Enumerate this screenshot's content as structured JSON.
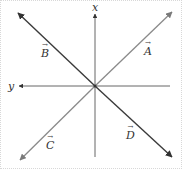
{
  "diagram": {
    "origin": [
      95,
      86
    ],
    "axes": {
      "x": {
        "label": "x",
        "direction": "up"
      },
      "y": {
        "label": "y",
        "direction": "left"
      }
    },
    "vectors": [
      {
        "name": "A",
        "label": "A",
        "direction": "upper-right"
      },
      {
        "name": "B",
        "label": "B",
        "direction": "upper-left"
      },
      {
        "name": "C",
        "label": "C",
        "direction": "lower-left"
      },
      {
        "name": "D",
        "label": "D",
        "direction": "lower-right"
      }
    ],
    "vector_arrow": "→",
    "colors": {
      "light_line": "#8a8a8a",
      "dark_line": "#3a3a3a",
      "text": "#333333"
    }
  }
}
